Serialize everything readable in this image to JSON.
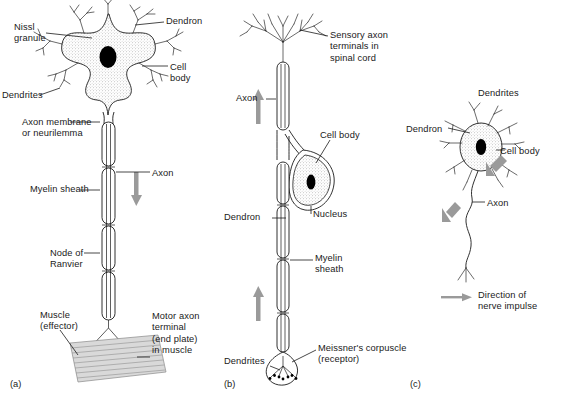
{
  "figure": {
    "background": "#ffffff",
    "ink_color": "#1a1a1a",
    "arrow_color": "#9a9a9a",
    "cellbody_fill": "stipple-grey",
    "muscle_fill": "#d9d9d9"
  },
  "panels": [
    {
      "id": "a",
      "id_label": "(a)",
      "name": "motor-neurone",
      "labels": [
        {
          "key": "nissl",
          "text": "Nissl\ngranule",
          "x": 14,
          "y": 22,
          "align": "left"
        },
        {
          "key": "dendron",
          "text": "Dendron",
          "x": 166,
          "y": 16,
          "align": "left"
        },
        {
          "key": "cell_body",
          "text": "Cell\nbody",
          "x": 170,
          "y": 62,
          "align": "left"
        },
        {
          "key": "dendrites",
          "text": "Dendrites",
          "x": 2,
          "y": 90,
          "align": "left"
        },
        {
          "key": "axon_membrane",
          "text": "Axon membrane\nor neurilemma",
          "x": 22,
          "y": 117,
          "align": "left"
        },
        {
          "key": "axon",
          "text": "Axon",
          "x": 152,
          "y": 168,
          "align": "left"
        },
        {
          "key": "myelin",
          "text": "Myelin sheath",
          "x": 30,
          "y": 184,
          "align": "left"
        },
        {
          "key": "node",
          "text": "Node of\nRanvier",
          "x": 50,
          "y": 248,
          "align": "left"
        },
        {
          "key": "muscle",
          "text": "Muscle\n(effector)",
          "x": 40,
          "y": 310,
          "align": "left"
        },
        {
          "key": "motor_terminal",
          "text": "Motor axon\nterminal\n(end plate)\nin muscle",
          "x": 152,
          "y": 311,
          "align": "left"
        }
      ]
    },
    {
      "id": "b",
      "id_label": "(b)",
      "name": "sensory-neurone",
      "labels": [
        {
          "key": "sensory_terminals",
          "text": "Sensory axon\nterminals in\nspinal cord",
          "x": 330,
          "y": 30,
          "align": "left"
        },
        {
          "key": "axon",
          "text": "Axon",
          "x": 236,
          "y": 93,
          "align": "left"
        },
        {
          "key": "cell_body",
          "text": "Cell body",
          "x": 320,
          "y": 130,
          "align": "left"
        },
        {
          "key": "nucleus",
          "text": "Nucleus",
          "x": 313,
          "y": 209,
          "align": "left"
        },
        {
          "key": "dendron",
          "text": "Dendron",
          "x": 224,
          "y": 212,
          "align": "left"
        },
        {
          "key": "myelin",
          "text": "Myelin\nsheath",
          "x": 315,
          "y": 253,
          "align": "left"
        },
        {
          "key": "dendrites",
          "text": "Dendrites",
          "x": 224,
          "y": 356,
          "align": "left"
        },
        {
          "key": "meissner",
          "text": "Meissner's corpuscle\n(receptor)",
          "x": 318,
          "y": 343,
          "align": "left"
        }
      ]
    },
    {
      "id": "c",
      "id_label": "(c)",
      "name": "relay-neurone",
      "labels": [
        {
          "key": "dendrites",
          "text": "Dendrites",
          "x": 478,
          "y": 88,
          "align": "left"
        },
        {
          "key": "dendron",
          "text": "Dendron",
          "x": 406,
          "y": 124,
          "align": "left"
        },
        {
          "key": "cell_body",
          "text": "Cell body",
          "x": 500,
          "y": 146,
          "align": "left"
        },
        {
          "key": "axon",
          "text": "Axon",
          "x": 487,
          "y": 198,
          "align": "left"
        }
      ]
    }
  ],
  "legend": {
    "name": "direction-of-nerve-impulse",
    "text": "Direction of\nnerve impulse",
    "arrow_color": "#9a9a9a",
    "x": 468,
    "y": 293
  },
  "panel_ids": [
    {
      "label": "(a)",
      "x": 10,
      "y": 379
    },
    {
      "label": "(b)",
      "x": 224,
      "y": 379
    },
    {
      "label": "(c)",
      "x": 410,
      "y": 379
    }
  ]
}
